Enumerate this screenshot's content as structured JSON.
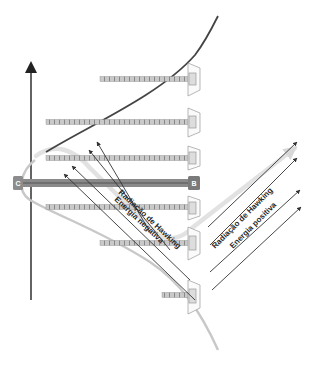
{
  "diagram": {
    "title": "",
    "colors": {
      "background": "#ffffff",
      "axis": "#222222",
      "upper_curve": "#444444",
      "lower_curve": "#c4c4c4",
      "path_band": "#e4e4e4",
      "bar": "#8a8a8a",
      "central_bar": "#7a7a7a",
      "arrow": "#333333",
      "tag_fill": "#8c8c8c"
    },
    "nodes": {
      "left_tag": "C",
      "right_tag": "B"
    },
    "labels": {
      "hawking_left": "Radiação de Hawking",
      "negative_energy": "Energia negativa",
      "hawking_right": "Radiação de Hawking",
      "positive_energy": "Energia positiva"
    },
    "bars": [
      {
        "y": 79,
        "x_start": 100,
        "x_end": 192
      },
      {
        "y": 122,
        "x_start": 46,
        "x_end": 192
      },
      {
        "y": 158,
        "x_start": 46,
        "x_end": 192
      },
      {
        "y": 207,
        "x_start": 46,
        "x_end": 192
      },
      {
        "y": 243,
        "x_start": 100,
        "x_end": 192
      },
      {
        "y": 295,
        "x_start": 164,
        "x_end": 192
      }
    ],
    "central_bar": {
      "y": 183,
      "x_start": 18,
      "x_end": 192
    }
  }
}
